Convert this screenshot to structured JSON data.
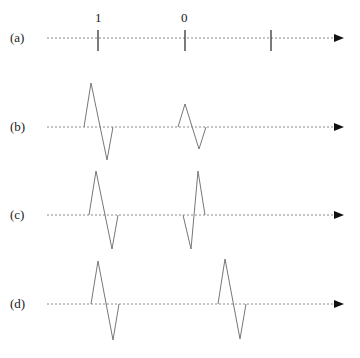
{
  "rows": [
    {
      "label": "(a)",
      "axis_y": 38
    },
    {
      "label": "(b)",
      "axis_y": 127
    },
    {
      "label": "(c)",
      "axis_y": 215
    },
    {
      "label": "(d)",
      "axis_y": 304
    }
  ],
  "tick_labels": [
    "1",
    "0"
  ],
  "colors": {
    "axis": "#8a8a8a",
    "pulse": "#777777",
    "tick": "#333333",
    "arrow": "#111111"
  }
}
